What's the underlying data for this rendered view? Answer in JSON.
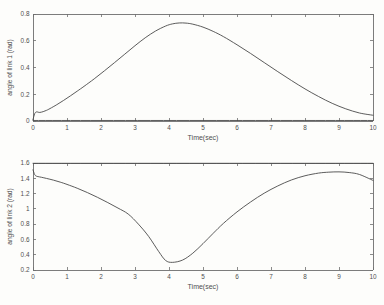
{
  "chart_data": [
    {
      "type": "line",
      "title": "",
      "xlabel": "Time(sec)",
      "ylabel": "angle of link 1 (rad)",
      "xlim": [
        0,
        10
      ],
      "ylim": [
        0,
        0.8
      ],
      "xticks": [
        "0",
        "1",
        "2",
        "3",
        "4",
        "5",
        "6",
        "7",
        "8",
        "9",
        "10"
      ],
      "yticks": [
        "0",
        "0.2",
        "0.4",
        "0.6",
        "0.8"
      ],
      "grid": false,
      "legend": "none",
      "line_color": "#4a4a4a",
      "series": [
        {
          "name": "angle of link 1",
          "x": [
            0.0,
            0.05,
            0.1,
            0.15,
            0.2,
            0.3,
            0.4,
            0.5,
            0.7,
            0.9,
            1.1,
            1.3,
            1.5,
            1.8,
            2.1,
            2.4,
            2.7,
            3.0,
            3.3,
            3.6,
            3.9,
            4.1,
            4.3,
            4.5,
            4.7,
            5.0,
            5.3,
            5.6,
            6.0,
            6.4,
            6.8,
            7.2,
            7.6,
            8.0,
            8.4,
            8.8,
            9.2,
            9.6,
            10.0
          ],
          "y": [
            0.01,
            0.055,
            0.068,
            0.066,
            0.064,
            0.07,
            0.08,
            0.093,
            0.122,
            0.154,
            0.188,
            0.223,
            0.259,
            0.315,
            0.375,
            0.437,
            0.5,
            0.563,
            0.622,
            0.672,
            0.71,
            0.726,
            0.733,
            0.732,
            0.724,
            0.702,
            0.67,
            0.631,
            0.57,
            0.505,
            0.437,
            0.369,
            0.303,
            0.24,
            0.183,
            0.132,
            0.091,
            0.06,
            0.043
          ]
        },
        {
          "name": "baseline",
          "x": [
            0.0,
            10.0
          ],
          "y": [
            0.004,
            0.004
          ]
        }
      ]
    },
    {
      "type": "line",
      "title": "",
      "xlabel": "Time(sec)",
      "ylabel": "angle of link 2 (rad)",
      "xlim": [
        0,
        10
      ],
      "ylim": [
        0.2,
        1.6
      ],
      "xticks": [
        "0",
        "1",
        "2",
        "3",
        "4",
        "5",
        "6",
        "7",
        "8",
        "9",
        "10"
      ],
      "yticks": [
        "0.2",
        "0.4",
        "0.6",
        "0.8",
        "1",
        "1.2",
        "1.4",
        "1.6"
      ],
      "grid": false,
      "legend": "none",
      "line_color": "#4a4a4a",
      "series": [
        {
          "name": "angle of link 2",
          "x": [
            0.0,
            0.05,
            0.1,
            0.15,
            0.25,
            0.4,
            0.6,
            0.8,
            1.0,
            1.3,
            1.6,
            1.9,
            2.2,
            2.5,
            2.8,
            3.1,
            3.4,
            3.7,
            3.9,
            4.1,
            4.4,
            4.7,
            5.0,
            5.3,
            5.6,
            6.0,
            6.4,
            6.8,
            7.2,
            7.6,
            8.0,
            8.4,
            8.7,
            9.0,
            9.3,
            9.6,
            10.0
          ],
          "y": [
            1.51,
            1.448,
            1.428,
            1.422,
            1.413,
            1.398,
            1.376,
            1.35,
            1.32,
            1.27,
            1.213,
            1.15,
            1.082,
            1.01,
            0.932,
            0.8,
            0.64,
            0.44,
            0.325,
            0.3,
            0.33,
            0.42,
            0.545,
            0.68,
            0.81,
            0.96,
            1.09,
            1.205,
            1.3,
            1.378,
            1.433,
            1.468,
            1.48,
            1.484,
            1.475,
            1.45,
            1.372
          ]
        },
        {
          "name": "topline",
          "x": [
            0.0,
            10.0
          ],
          "y": [
            1.596,
            1.596
          ]
        }
      ]
    }
  ]
}
